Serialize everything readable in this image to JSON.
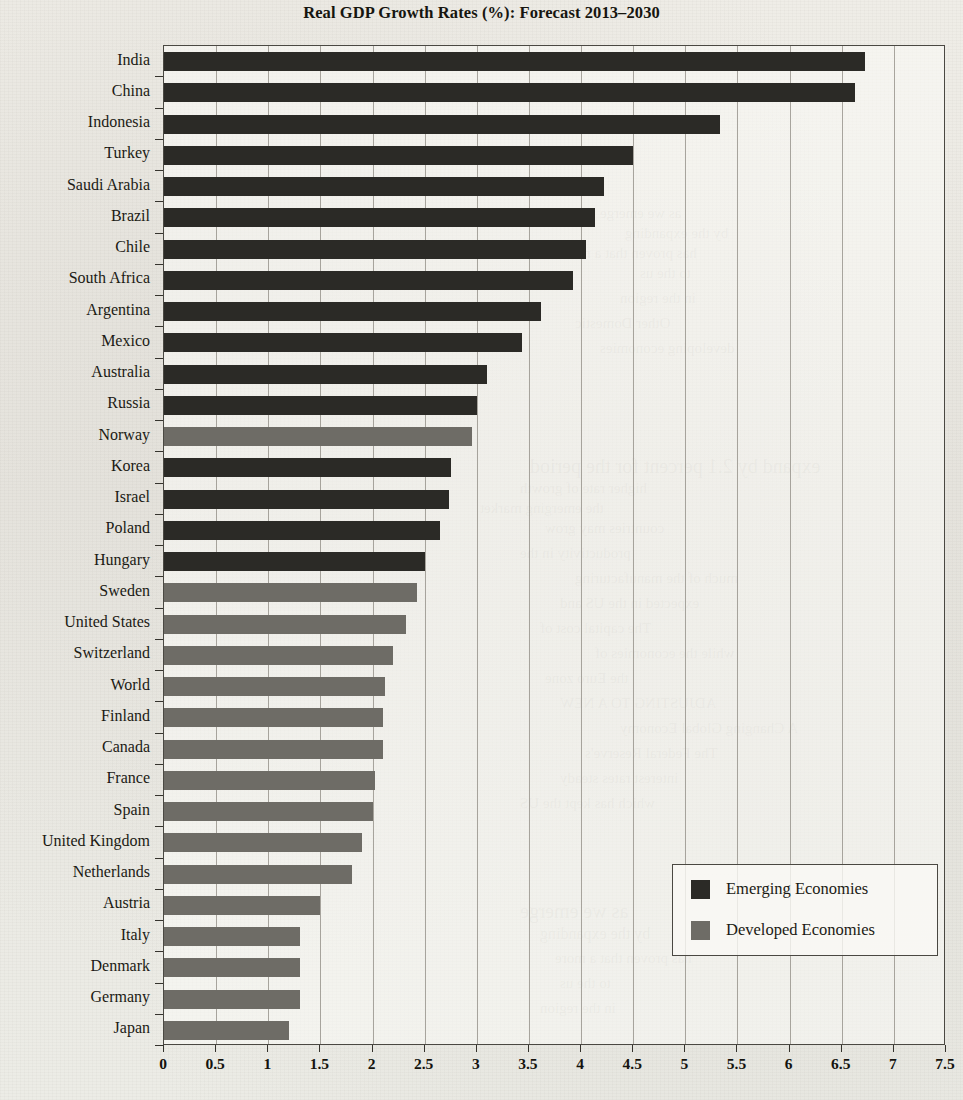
{
  "chart_data": {
    "type": "bar",
    "orientation": "horizontal",
    "title": "Real GDP Growth Rates (%): Forecast 2013–2030",
    "xlabel": "",
    "ylabel": "",
    "xlim": [
      0,
      7.5
    ],
    "xticks": [
      "0",
      "0.5",
      "1",
      "1.5",
      "2",
      "2.5",
      "3",
      "3.5",
      "4",
      "4.5",
      "5",
      "5.5",
      "6",
      "6.5",
      "7",
      "7.5"
    ],
    "xtick_values": [
      0,
      0.5,
      1,
      1.5,
      2,
      2.5,
      3,
      3.5,
      4,
      4.5,
      5,
      5.5,
      6,
      6.5,
      7,
      7.5
    ],
    "grid": true,
    "grid_axis": "x",
    "legend_position": "lower-right",
    "categories": [
      "India",
      "China",
      "Indonesia",
      "Turkey",
      "Saudi Arabia",
      "Brazil",
      "Chile",
      "South Africa",
      "Argentina",
      "Mexico",
      "Australia",
      "Russia",
      "Norway",
      "Korea",
      "Israel",
      "Poland",
      "Hungary",
      "Sweden",
      "United States",
      "Switzerland",
      "World",
      "Finland",
      "Canada",
      "France",
      "Spain",
      "United Kingdom",
      "Netherlands",
      "Austria",
      "Italy",
      "Denmark",
      "Germany",
      "Japan"
    ],
    "values": [
      6.72,
      6.63,
      5.33,
      4.5,
      4.22,
      4.13,
      4.05,
      3.92,
      3.62,
      3.43,
      3.1,
      3.0,
      2.95,
      2.75,
      2.73,
      2.65,
      2.5,
      2.43,
      2.32,
      2.2,
      2.12,
      2.1,
      2.1,
      2.02,
      2.0,
      1.9,
      1.8,
      1.5,
      1.3,
      1.3,
      1.3,
      1.2
    ],
    "groups": [
      "emerging",
      "emerging",
      "emerging",
      "emerging",
      "emerging",
      "emerging",
      "emerging",
      "emerging",
      "emerging",
      "emerging",
      "emerging",
      "emerging",
      "developed",
      "emerging",
      "emerging",
      "emerging",
      "emerging",
      "developed",
      "developed",
      "developed",
      "developed",
      "developed",
      "developed",
      "developed",
      "developed",
      "developed",
      "developed",
      "developed",
      "developed",
      "developed",
      "developed",
      "developed"
    ],
    "series": [
      {
        "name": "Emerging Economies",
        "color": "#2b2a26"
      },
      {
        "name": "Developed Economies",
        "color": "#6e6c66"
      }
    ]
  },
  "legend": {
    "items": [
      {
        "label": "Emerging Economies",
        "swatch": "emerging"
      },
      {
        "label": "Developed Economies",
        "swatch": "developed"
      }
    ]
  },
  "page_bleed_text": [
    "as we emerge",
    "by the expanding",
    "has proven that a more",
    "to the us",
    "in the region",
    "Other Domestic",
    "developing economies",
    "expand by 2.1 percent for the period",
    "higher rate of growth",
    "the emerging market",
    "countries may grow",
    "productivity in the",
    "much of the manufacturing",
    "expected in the US and",
    "The capital cost of",
    "while the economies of",
    "the Euro zone",
    "ADJUSTING TO A NEW",
    "A Changing Global Economy",
    "The Federal Reserve's",
    "interest rates steady",
    "which has kept the US"
  ]
}
